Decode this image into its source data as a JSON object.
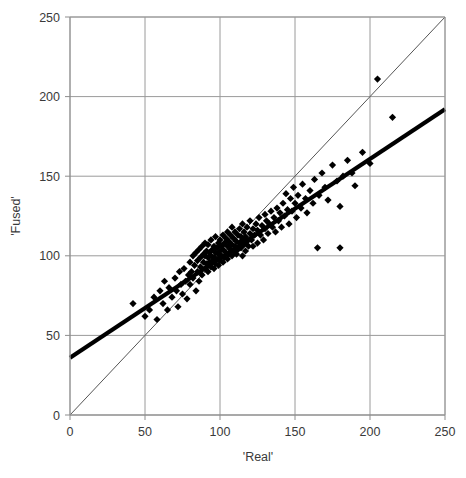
{
  "chart_data": {
    "type": "scatter",
    "title": "",
    "xlabel": "'Real'",
    "ylabel": "'Fused'",
    "xlim": [
      0,
      250
    ],
    "ylim": [
      0,
      250
    ],
    "xticks": [
      0,
      50,
      100,
      150,
      200,
      250
    ],
    "yticks": [
      0,
      50,
      100,
      150,
      200,
      250
    ],
    "grid": true,
    "legend": null,
    "marker": "diamond",
    "marker_color": "#000000",
    "series": [
      {
        "name": "Fused vs Real",
        "points": [
          [
            42,
            70
          ],
          [
            50,
            62
          ],
          [
            53,
            66
          ],
          [
            56,
            74
          ],
          [
            58,
            60
          ],
          [
            60,
            78
          ],
          [
            62,
            70
          ],
          [
            63,
            84
          ],
          [
            65,
            66
          ],
          [
            66,
            80
          ],
          [
            68,
            74
          ],
          [
            70,
            86
          ],
          [
            71,
            78
          ],
          [
            72,
            68
          ],
          [
            73,
            90
          ],
          [
            74,
            82
          ],
          [
            75,
            76
          ],
          [
            76,
            92
          ],
          [
            77,
            84
          ],
          [
            78,
            73
          ],
          [
            79,
            88
          ],
          [
            80,
            96
          ],
          [
            80,
            82
          ],
          [
            81,
            90
          ],
          [
            82,
            100
          ],
          [
            82,
            86
          ],
          [
            83,
            94
          ],
          [
            84,
            78
          ],
          [
            84,
            102
          ],
          [
            85,
            90
          ],
          [
            85,
            97
          ],
          [
            86,
            84
          ],
          [
            86,
            104
          ],
          [
            87,
            93
          ],
          [
            87,
            99
          ],
          [
            88,
            88
          ],
          [
            88,
            106
          ],
          [
            89,
            96
          ],
          [
            89,
            101
          ],
          [
            90,
            92
          ],
          [
            90,
            100
          ],
          [
            90,
            108
          ],
          [
            91,
            95
          ],
          [
            91,
            103
          ],
          [
            92,
            90
          ],
          [
            92,
            99
          ],
          [
            92,
            107
          ],
          [
            93,
            96
          ],
          [
            93,
            102
          ],
          [
            94,
            93
          ],
          [
            94,
            100
          ],
          [
            94,
            110
          ],
          [
            95,
            97
          ],
          [
            95,
            104
          ],
          [
            96,
            92
          ],
          [
            96,
            99
          ],
          [
            96,
            106
          ],
          [
            97,
            95
          ],
          [
            97,
            102
          ],
          [
            97,
            112
          ],
          [
            98,
            98
          ],
          [
            98,
            105
          ],
          [
            99,
            94
          ],
          [
            99,
            101
          ],
          [
            99,
            108
          ],
          [
            100,
            97
          ],
          [
            100,
            103
          ],
          [
            100,
            110
          ],
          [
            101,
            100
          ],
          [
            101,
            106
          ],
          [
            102,
            96
          ],
          [
            102,
            104
          ],
          [
            102,
            113
          ],
          [
            103,
            99
          ],
          [
            103,
            108
          ],
          [
            104,
            102
          ],
          [
            104,
            111
          ],
          [
            105,
            98
          ],
          [
            105,
            106
          ],
          [
            105,
            115
          ],
          [
            106,
            101
          ],
          [
            106,
            109
          ],
          [
            107,
            104
          ],
          [
            107,
            113
          ],
          [
            108,
            100
          ],
          [
            108,
            107
          ],
          [
            108,
            118
          ],
          [
            109,
            103
          ],
          [
            109,
            111
          ],
          [
            110,
            106
          ],
          [
            110,
            115
          ],
          [
            111,
            101
          ],
          [
            111,
            109
          ],
          [
            112,
            104
          ],
          [
            112,
            113
          ],
          [
            113,
            108
          ],
          [
            113,
            117
          ],
          [
            114,
            105
          ],
          [
            114,
            112
          ],
          [
            115,
            100
          ],
          [
            115,
            110
          ],
          [
            115,
            120
          ],
          [
            116,
            107
          ],
          [
            116,
            115
          ],
          [
            117,
            103
          ],
          [
            117,
            112
          ],
          [
            118,
            109
          ],
          [
            118,
            118
          ],
          [
            119,
            106
          ],
          [
            120,
            114
          ],
          [
            120,
            122
          ],
          [
            121,
            110
          ],
          [
            122,
            117
          ],
          [
            122,
            106
          ],
          [
            123,
            113
          ],
          [
            124,
            120
          ],
          [
            125,
            108
          ],
          [
            125,
            116
          ],
          [
            126,
            124
          ],
          [
            127,
            113
          ],
          [
            128,
            119
          ],
          [
            129,
            110
          ],
          [
            130,
            117
          ],
          [
            130,
            126
          ],
          [
            131,
            122
          ],
          [
            132,
            114
          ],
          [
            133,
            120
          ],
          [
            134,
            128
          ],
          [
            135,
            118
          ],
          [
            136,
            124
          ],
          [
            137,
            115
          ],
          [
            138,
            130
          ],
          [
            139,
            122
          ],
          [
            140,
            127
          ],
          [
            141,
            118
          ],
          [
            142,
            133
          ],
          [
            143,
            125
          ],
          [
            144,
            139
          ],
          [
            145,
            129
          ],
          [
            146,
            120
          ],
          [
            147,
            136
          ],
          [
            148,
            128
          ],
          [
            149,
            143
          ],
          [
            150,
            133
          ],
          [
            151,
            124
          ],
          [
            152,
            138
          ],
          [
            154,
            130
          ],
          [
            155,
            145
          ],
          [
            157,
            136
          ],
          [
            158,
            127
          ],
          [
            160,
            141
          ],
          [
            162,
            133
          ],
          [
            163,
            148
          ],
          [
            165,
            105
          ],
          [
            166,
            138
          ],
          [
            168,
            152
          ],
          [
            170,
            143
          ],
          [
            172,
            135
          ],
          [
            175,
            157
          ],
          [
            178,
            147
          ],
          [
            180,
            105
          ],
          [
            180,
            131
          ],
          [
            182,
            150
          ],
          [
            185,
            160
          ],
          [
            188,
            152
          ],
          [
            190,
            144
          ],
          [
            195,
            165
          ],
          [
            200,
            158
          ],
          [
            205,
            211
          ],
          [
            215,
            187
          ]
        ]
      }
    ],
    "lines": [
      {
        "name": "identity-line",
        "style": "thin",
        "color": "#555555",
        "from": [
          0,
          0
        ],
        "to": [
          250,
          250
        ]
      },
      {
        "name": "regression-line",
        "style": "thick",
        "color": "#000000",
        "from": [
          0,
          36
        ],
        "to": [
          250,
          192
        ]
      }
    ]
  },
  "axes": {
    "x_title": "'Real'",
    "y_title": "'Fused'",
    "x_tick_labels": [
      "0",
      "50",
      "100",
      "150",
      "200",
      "250"
    ],
    "y_tick_labels": [
      "0",
      "50",
      "100",
      "150",
      "200",
      "250"
    ]
  },
  "caption": {
    "text": ""
  }
}
